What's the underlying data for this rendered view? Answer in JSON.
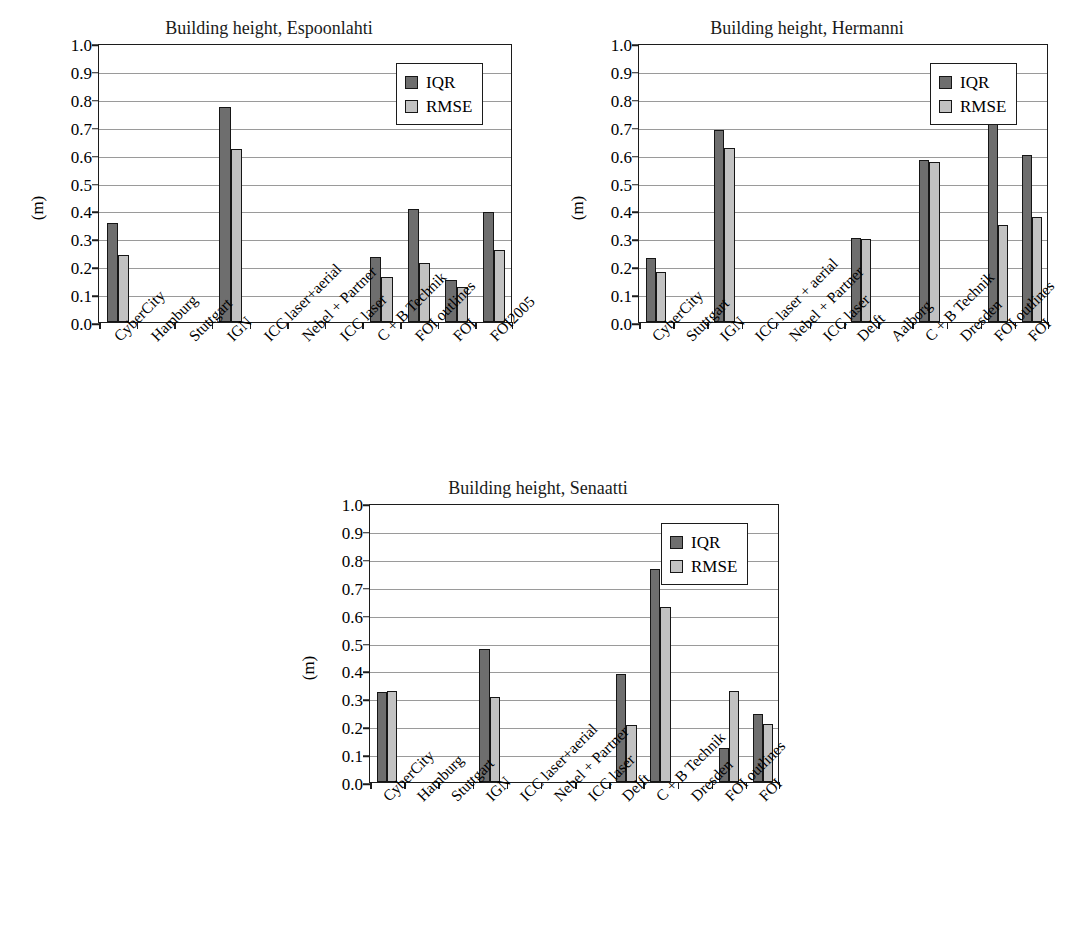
{
  "chart_data": [
    {
      "type": "bar",
      "title": "Building height, Espoonlahti",
      "xlabel": "",
      "ylabel": "(m)",
      "ylim": [
        0.0,
        1.0
      ],
      "ytick_labels": [
        "0.0",
        "0.1",
        "0.2",
        "0.3",
        "0.4",
        "0.5",
        "0.6",
        "0.7",
        "0.8",
        "0.9",
        "1.0"
      ],
      "grid": true,
      "legend": [
        "IQR",
        "RMSE"
      ],
      "legend_position": "top-right",
      "categories": [
        "CyberCity",
        "Hamburg",
        "Stuttgart",
        "IGN",
        "ICC laser+aerial",
        "Nebel + Partner",
        "ICC laser",
        "C + B Technik",
        "FOI outlines",
        "FOI",
        "FOI2005"
      ],
      "series": [
        {
          "name": "IQR",
          "values": [
            0.355,
            null,
            null,
            0.77,
            null,
            null,
            null,
            0.233,
            0.405,
            0.152,
            0.395
          ]
        },
        {
          "name": "RMSE",
          "values": [
            0.24,
            null,
            null,
            0.62,
            null,
            null,
            null,
            0.163,
            0.21,
            0.127,
            0.257
          ]
        }
      ]
    },
    {
      "type": "bar",
      "title": "Building height, Hermanni",
      "xlabel": "",
      "ylabel": "(m)",
      "ylim": [
        0.0,
        1.0
      ],
      "ytick_labels": [
        "0.0",
        "0.1",
        "0.2",
        "0.3",
        "0.4",
        "0.5",
        "0.6",
        "0.7",
        "0.8",
        "0.9",
        "1.0"
      ],
      "grid": true,
      "legend": [
        "IQR",
        "RMSE"
      ],
      "legend_position": "top-right",
      "categories": [
        "CyberCity",
        "Stuttgart",
        "IGN",
        "ICC laser + aerial",
        "Nebel + Partner",
        "ICC laser",
        "Delft",
        "Aalborg",
        "C + B Technik",
        "Dresden",
        "FOI outlines",
        "FOI"
      ],
      "series": [
        {
          "name": "IQR",
          "values": [
            0.23,
            null,
            0.69,
            null,
            null,
            null,
            0.3,
            null,
            0.58,
            null,
            0.71,
            0.6
          ]
        },
        {
          "name": "RMSE",
          "values": [
            0.18,
            null,
            0.625,
            null,
            null,
            null,
            0.298,
            null,
            0.573,
            null,
            0.348,
            0.375
          ]
        }
      ]
    },
    {
      "type": "bar",
      "title": "Building height, Senaatti",
      "xlabel": "",
      "ylabel": "(m)",
      "ylim": [
        0.0,
        1.0
      ],
      "ytick_labels": [
        "0.0",
        "0.1",
        "0.2",
        "0.3",
        "0.4",
        "0.5",
        "0.6",
        "0.7",
        "0.8",
        "0.9",
        "1.0"
      ],
      "grid": true,
      "legend": [
        "IQR",
        "RMSE"
      ],
      "legend_position": "top-right",
      "categories": [
        "CyberCity",
        "Hamburg",
        "Stuttgart",
        "IGN",
        "ICC laser+aerial",
        "Nebel + Partner",
        "ICC laser",
        "Delft",
        "C + B Technik",
        "Dresden",
        "FOI outlines",
        "FOI"
      ],
      "series": [
        {
          "name": "IQR",
          "values": [
            0.322,
            null,
            null,
            0.475,
            null,
            null,
            null,
            0.388,
            0.765,
            null,
            0.122,
            0.245
          ]
        },
        {
          "name": "RMSE",
          "values": [
            0.328,
            null,
            null,
            0.303,
            null,
            null,
            null,
            0.205,
            0.628,
            null,
            0.328,
            0.208
          ]
        }
      ]
    }
  ],
  "colors": {
    "iqr": "#6e6e6e",
    "rmse": "#c2c2c2",
    "axis": "#1c1c1c",
    "grid": "#9a9a9a",
    "background": "#ffffff"
  }
}
